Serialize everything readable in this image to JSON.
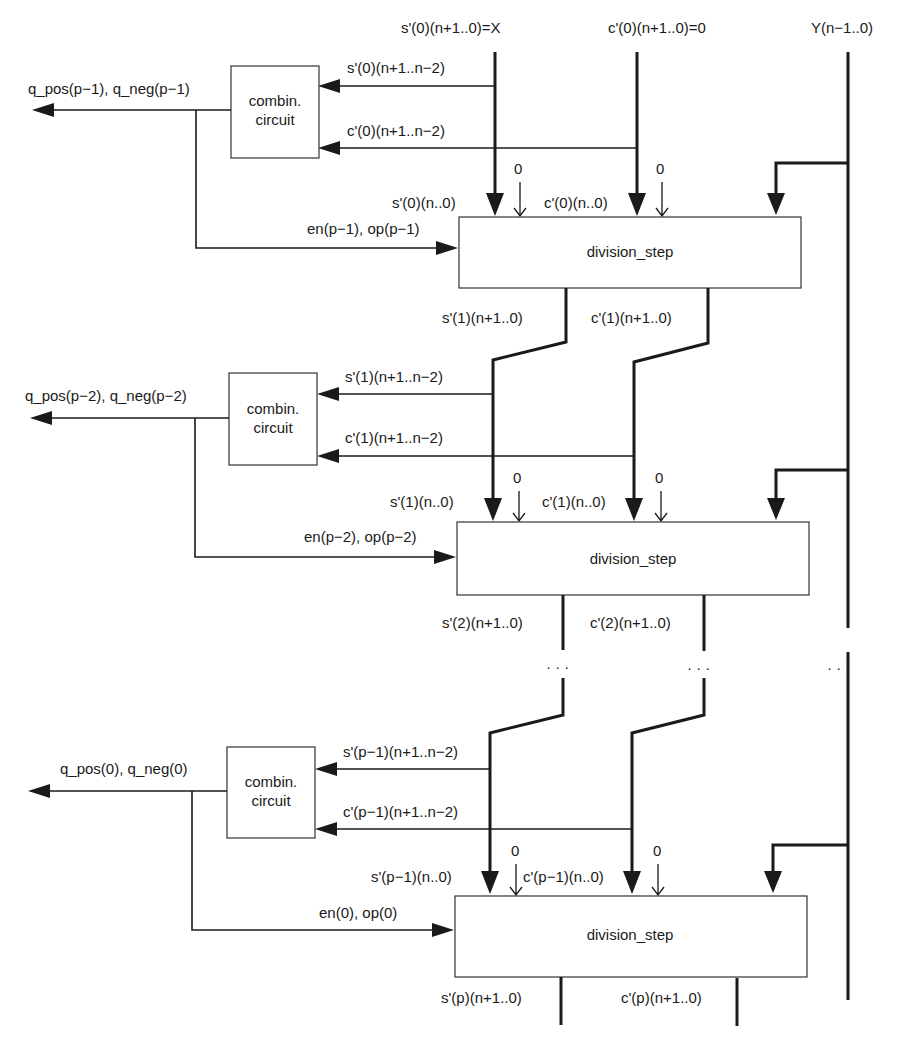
{
  "diagram": {
    "inputs": {
      "s_initial": "s'(0)(n+1..0)=X",
      "c_initial": "c'(0)(n+1..0)=0",
      "y_input": "Y(n−1..0)"
    },
    "stages": [
      {
        "q_output": "q_pos(p−1), q_neg(p−1)",
        "combin_line1": "combin.",
        "combin_line2": "circuit",
        "s_msb": "s'(0)(n+1..n−2)",
        "c_msb": "c'(0)(n+1..n−2)",
        "s_in": "s'(0)(n..0)",
        "c_in": "c'(0)(n..0)",
        "zero_s": "0",
        "zero_c": "0",
        "control": "en(p−1), op(p−1)",
        "block": "division_step",
        "s_out": "s'(1)(n+1..0)",
        "c_out": "c'(1)(n+1..0)"
      },
      {
        "q_output": "q_pos(p−2), q_neg(p−2)",
        "combin_line1": "combin.",
        "combin_line2": "circuit",
        "s_msb": "s'(1)(n+1..n−2)",
        "c_msb": "c'(1)(n+1..n−2)",
        "s_in": "s'(1)(n..0)",
        "c_in": "c'(1)(n..0)",
        "zero_s": "0",
        "zero_c": "0",
        "control": "en(p−2), op(p−2)",
        "block": "division_step",
        "s_out": "s'(2)(n+1..0)",
        "c_out": "c'(2)(n+1..0)"
      },
      {
        "q_output": "q_pos(0), q_neg(0)",
        "combin_line1": "combin.",
        "combin_line2": "circuit",
        "s_msb": "s'(p−1)(n+1..n−2)",
        "c_msb": "c'(p−1)(n+1..n−2)",
        "s_in": "s'(p−1)(n..0)",
        "c_in": "c'(p−1)(n..0)",
        "zero_s": "0",
        "zero_c": "0",
        "control": "en(0), op(0)",
        "block": "division_step",
        "s_out": "s'(p)(n+1..0)",
        "c_out": "c'(p)(n+1..0)"
      }
    ],
    "ellipsis": "· · ·"
  }
}
